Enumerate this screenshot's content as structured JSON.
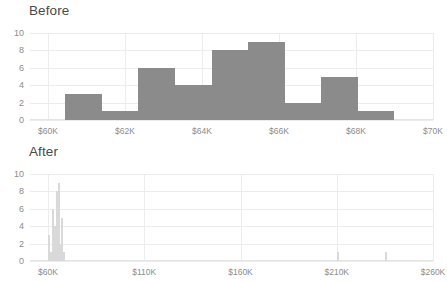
{
  "figure": {
    "background": "#ffffff",
    "bar_color_before": "#8b8b8b",
    "bar_color_after": "#d9d9d9",
    "grid_color": "#ececec",
    "tick_label_color": "#8c8c8c",
    "title_color": "#4a4a4a"
  },
  "panels": [
    {
      "id": "before",
      "title": "Before"
    },
    {
      "id": "after",
      "title": "After"
    }
  ],
  "chart_data": [
    {
      "type": "bar",
      "id": "before",
      "title": "Before",
      "xlabel": "",
      "ylabel": "",
      "xlim": [
        59400,
        70000
      ],
      "ylim": [
        0,
        10
      ],
      "grid": true,
      "legend": false,
      "xtick_labels": [
        "$60K",
        "$62K",
        "$64K",
        "$66K",
        "$68K",
        "$70K"
      ],
      "xtick_values": [
        60000,
        62000,
        64000,
        66000,
        68000,
        70000
      ],
      "ytick_labels": [
        "0",
        "2",
        "4",
        "6",
        "8",
        "10"
      ],
      "ytick_values": [
        0,
        2,
        4,
        6,
        8,
        10
      ],
      "bins": [
        {
          "left": 60450,
          "right": 61400,
          "value": 3
        },
        {
          "left": 61400,
          "right": 62350,
          "value": 1
        },
        {
          "left": 62350,
          "right": 63300,
          "value": 6
        },
        {
          "left": 63300,
          "right": 64250,
          "value": 4
        },
        {
          "left": 64250,
          "right": 65200,
          "value": 8
        },
        {
          "left": 65200,
          "right": 66150,
          "value": 9
        },
        {
          "left": 66150,
          "right": 67100,
          "value": 2
        },
        {
          "left": 67100,
          "right": 68050,
          "value": 5
        },
        {
          "left": 68050,
          "right": 69000,
          "value": 1
        }
      ],
      "values": [
        3,
        1,
        6,
        4,
        8,
        9,
        2,
        5,
        1
      ]
    },
    {
      "type": "bar",
      "id": "after",
      "title": "After",
      "xlabel": "",
      "ylabel": "",
      "xlim": [
        56000,
        266000
      ],
      "ylim": [
        0,
        10
      ],
      "grid": true,
      "legend": false,
      "xtick_labels": [
        "$60K",
        "$110K",
        "$160K",
        "$210K",
        "$260K"
      ],
      "xtick_values": [
        60000,
        110000,
        160000,
        210000,
        260000
      ],
      "ytick_labels": [
        "0",
        "2",
        "4",
        "6",
        "8",
        "10"
      ],
      "ytick_values": [
        0,
        2,
        4,
        6,
        8,
        10
      ],
      "bins": [
        {
          "left": 60000,
          "right": 61000,
          "value": 3
        },
        {
          "left": 61000,
          "right": 62000,
          "value": 1
        },
        {
          "left": 62000,
          "right": 63000,
          "value": 6
        },
        {
          "left": 63000,
          "right": 64000,
          "value": 4
        },
        {
          "left": 64000,
          "right": 65000,
          "value": 8
        },
        {
          "left": 65000,
          "right": 66000,
          "value": 9
        },
        {
          "left": 66000,
          "right": 67000,
          "value": 2
        },
        {
          "left": 67000,
          "right": 68000,
          "value": 5
        },
        {
          "left": 68000,
          "right": 69000,
          "value": 1
        },
        {
          "left": 210000,
          "right": 211000,
          "value": 1
        },
        {
          "left": 235000,
          "right": 236000,
          "value": 1
        }
      ],
      "values": [
        3,
        1,
        6,
        4,
        8,
        9,
        2,
        5,
        1,
        1,
        1
      ]
    }
  ]
}
